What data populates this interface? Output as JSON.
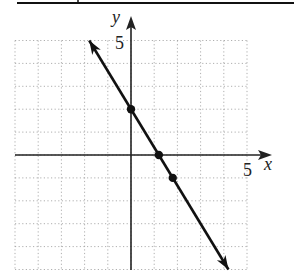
{
  "chart_data": {
    "type": "line",
    "title": "",
    "xlabel": "x",
    "ylabel": "y",
    "xlim": [
      -5,
      5
    ],
    "ylim": [
      -5,
      5
    ],
    "grid": true,
    "grid_style": "dotted",
    "tick_labels": {
      "x": "5",
      "y": "5"
    },
    "series": [
      {
        "name": "line",
        "equation": "y = -(5/3)x + 2",
        "arrows": "both",
        "x": [
          -1.8,
          4.2
        ],
        "y": [
          5,
          -5
        ]
      }
    ],
    "points": [
      {
        "x": 0,
        "y": 2
      },
      {
        "x": 1.2,
        "y": 0
      },
      {
        "x": 1.8,
        "y": -1
      }
    ]
  },
  "axes": {
    "x_label": "x",
    "y_label": "y",
    "x_tick": "5",
    "y_tick": "5"
  },
  "colors": {
    "line": "#111111",
    "grid": "#9a9a9a",
    "axis": "#222222",
    "background": "#ffffff"
  }
}
